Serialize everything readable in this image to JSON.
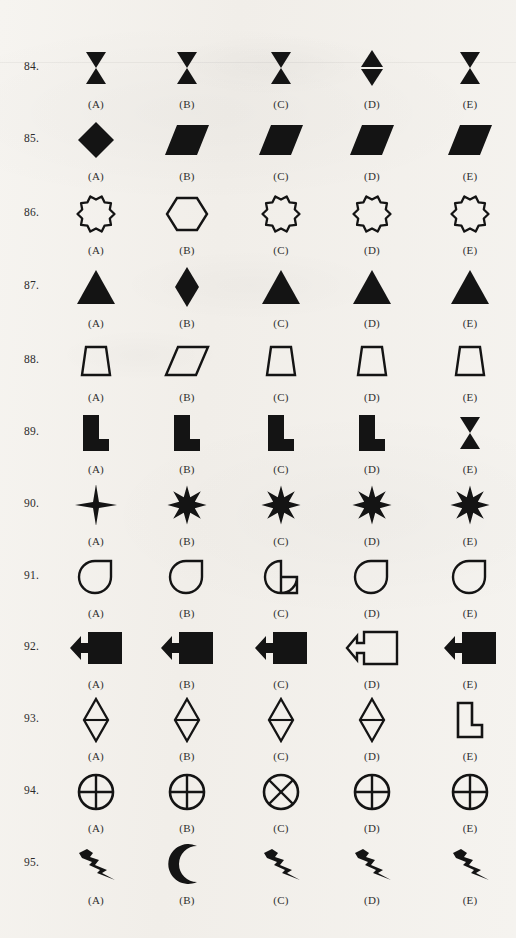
{
  "page": {
    "background_color": "#f4f2ee",
    "ink_color": "#141414",
    "option_labels": [
      "(A)",
      "(B)",
      "(C)",
      "(D)",
      "(E)"
    ]
  },
  "questions": [
    {
      "number": "84.",
      "y": 40,
      "options": [
        {
          "label": "(A)",
          "shape": "hourglass-bowtie-vertical"
        },
        {
          "label": "(B)",
          "shape": "hourglass-bowtie-vertical"
        },
        {
          "label": "(C)",
          "shape": "hourglass-bowtie-vertical"
        },
        {
          "label": "(D)",
          "shape": "diamond-split-horizontal-filled"
        },
        {
          "label": "(E)",
          "shape": "hourglass-bowtie-vertical"
        }
      ]
    },
    {
      "number": "85.",
      "y": 112,
      "options": [
        {
          "label": "(A)",
          "shape": "diamond-filled"
        },
        {
          "label": "(B)",
          "shape": "parallelogram-filled"
        },
        {
          "label": "(C)",
          "shape": "parallelogram-filled"
        },
        {
          "label": "(D)",
          "shape": "parallelogram-filled"
        },
        {
          "label": "(E)",
          "shape": "parallelogram-filled"
        }
      ]
    },
    {
      "number": "86.",
      "y": 186,
      "options": [
        {
          "label": "(A)",
          "shape": "scalloped-star-outline"
        },
        {
          "label": "(B)",
          "shape": "hexagon-outline"
        },
        {
          "label": "(C)",
          "shape": "scalloped-star-outline"
        },
        {
          "label": "(D)",
          "shape": "scalloped-star-outline"
        },
        {
          "label": "(E)",
          "shape": "scalloped-star-outline"
        }
      ]
    },
    {
      "number": "87.",
      "y": 259,
      "options": [
        {
          "label": "(A)",
          "shape": "triangle-filled"
        },
        {
          "label": "(B)",
          "shape": "diamond-tall-filled"
        },
        {
          "label": "(C)",
          "shape": "triangle-filled"
        },
        {
          "label": "(D)",
          "shape": "triangle-filled"
        },
        {
          "label": "(E)",
          "shape": "triangle-filled"
        }
      ]
    },
    {
      "number": "88.",
      "y": 333,
      "options": [
        {
          "label": "(A)",
          "shape": "trapezoid-outline"
        },
        {
          "label": "(B)",
          "shape": "parallelogram-outline"
        },
        {
          "label": "(C)",
          "shape": "trapezoid-outline"
        },
        {
          "label": "(D)",
          "shape": "trapezoid-outline"
        },
        {
          "label": "(E)",
          "shape": "trapezoid-outline"
        }
      ]
    },
    {
      "number": "89.",
      "y": 405,
      "options": [
        {
          "label": "(A)",
          "shape": "l-block-filled"
        },
        {
          "label": "(B)",
          "shape": "l-block-filled"
        },
        {
          "label": "(C)",
          "shape": "l-block-filled"
        },
        {
          "label": "(D)",
          "shape": "l-block-filled"
        },
        {
          "label": "(E)",
          "shape": "hourglass-bowtie-vertical"
        }
      ]
    },
    {
      "number": "90.",
      "y": 477,
      "options": [
        {
          "label": "(A)",
          "shape": "four-point-star-filled"
        },
        {
          "label": "(B)",
          "shape": "eight-point-star-filled"
        },
        {
          "label": "(C)",
          "shape": "eight-point-star-filled"
        },
        {
          "label": "(D)",
          "shape": "eight-point-star-filled"
        },
        {
          "label": "(E)",
          "shape": "eight-point-star-filled"
        }
      ]
    },
    {
      "number": "91.",
      "y": 549,
      "options": [
        {
          "label": "(A)",
          "shape": "teardrop-outline"
        },
        {
          "label": "(B)",
          "shape": "teardrop-outline"
        },
        {
          "label": "(C)",
          "shape": "pie-wedge-cut-outline"
        },
        {
          "label": "(D)",
          "shape": "teardrop-outline"
        },
        {
          "label": "(E)",
          "shape": "teardrop-outline"
        }
      ]
    },
    {
      "number": "92.",
      "y": 620,
      "options": [
        {
          "label": "(A)",
          "shape": "block-arrow-left-filled"
        },
        {
          "label": "(B)",
          "shape": "block-arrow-left-filled"
        },
        {
          "label": "(C)",
          "shape": "block-arrow-left-filled"
        },
        {
          "label": "(D)",
          "shape": "block-arrow-left-outline"
        },
        {
          "label": "(E)",
          "shape": "block-arrow-left-filled"
        }
      ]
    },
    {
      "number": "93.",
      "y": 692,
      "options": [
        {
          "label": "(A)",
          "shape": "diamond-bisected-outline"
        },
        {
          "label": "(B)",
          "shape": "diamond-bisected-outline"
        },
        {
          "label": "(C)",
          "shape": "diamond-bisected-outline"
        },
        {
          "label": "(D)",
          "shape": "diamond-bisected-outline"
        },
        {
          "label": "(E)",
          "shape": "l-block-outline"
        }
      ]
    },
    {
      "number": "94.",
      "y": 764,
      "options": [
        {
          "label": "(A)",
          "shape": "circle-plus-outline"
        },
        {
          "label": "(B)",
          "shape": "circle-plus-outline"
        },
        {
          "label": "(C)",
          "shape": "circle-cross-outline"
        },
        {
          "label": "(D)",
          "shape": "circle-plus-outline"
        },
        {
          "label": "(E)",
          "shape": "circle-plus-outline"
        }
      ]
    },
    {
      "number": "95.",
      "y": 836,
      "options": [
        {
          "label": "(A)",
          "shape": "lightning-bolt-filled"
        },
        {
          "label": "(B)",
          "shape": "crescent-moon-filled"
        },
        {
          "label": "(C)",
          "shape": "lightning-bolt-filled"
        },
        {
          "label": "(D)",
          "shape": "lightning-bolt-filled"
        },
        {
          "label": "(E)",
          "shape": "lightning-bolt-filled"
        }
      ]
    }
  ],
  "column_x": [
    50,
    141,
    235,
    326,
    424
  ]
}
